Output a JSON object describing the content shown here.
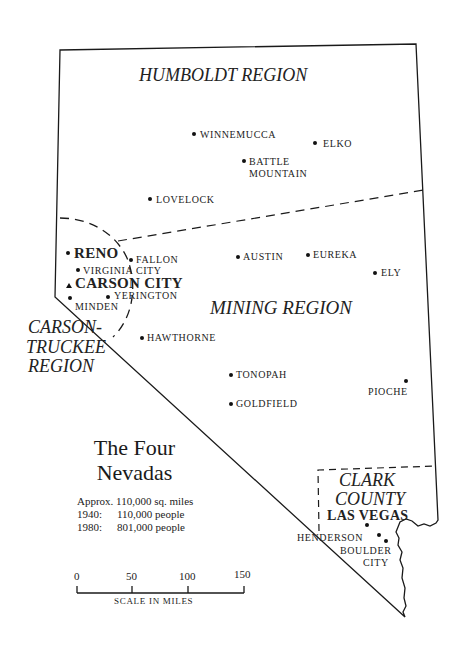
{
  "map": {
    "title_line1": "The Four",
    "title_line2": "Nevadas",
    "regions": {
      "humboldt": "HUMBOLDT REGION",
      "mining": "MINING REGION",
      "carson_line1": "CARSON-",
      "carson_line2": "TRUCKEE",
      "carson_line3": "REGION",
      "clark_line1": "CLARK",
      "clark_line2": "COUNTY"
    },
    "cities": {
      "winnemucca": "WINNEMUCCA",
      "elko": "ELKO",
      "battle_mountain_1": "BATTLE",
      "battle_mountain_2": "MOUNTAIN",
      "lovelock": "LOVELOCK",
      "reno": "RENO",
      "fallon": "FALLON",
      "virginia_city": "VIRGINIA CITY",
      "carson_city": "CARSON CITY",
      "yerington": "YERINGTON",
      "minden": "MINDEN",
      "austin": "AUSTIN",
      "eureka": "EUREKA",
      "ely": "ELY",
      "hawthorne": "HAWTHORNE",
      "tonopah": "TONOPAH",
      "goldfield": "GOLDFIELD",
      "pioche": "PIOCHE",
      "las_vegas": "LAS VEGAS",
      "henderson": "HENDERSON",
      "boulder_city_1": "BOULDER",
      "boulder_city_2": "CITY"
    },
    "facts": {
      "area": "Approx. 110,000 sq. miles",
      "y1940_label": "1940:",
      "y1940_value": "110,000 people",
      "y1980_label": "1980:",
      "y1980_value": "801,000 people"
    },
    "scale": {
      "ticks": [
        "0",
        "50",
        "100",
        "150"
      ],
      "label": "SCALE IN MILES"
    },
    "colors": {
      "ink": "#1a1a1a",
      "background": "#ffffff"
    }
  }
}
